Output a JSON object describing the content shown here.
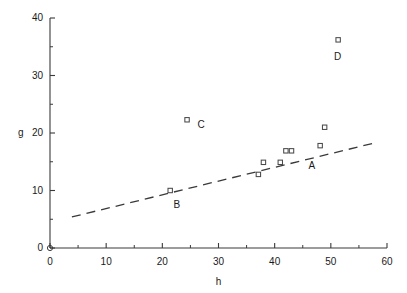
{
  "chart_data": {
    "type": "scatter",
    "title": "",
    "xlabel": "h",
    "ylabel": "g",
    "xlim": [
      0,
      60
    ],
    "ylim": [
      0,
      40
    ],
    "xticks": [
      0,
      10,
      20,
      30,
      40,
      50,
      60
    ],
    "yticks": [
      0,
      10,
      20,
      30,
      40
    ],
    "xtick_labels": [
      "0",
      "10",
      "20",
      "30",
      "40",
      "50",
      "60"
    ],
    "ytick_labels": [
      "0",
      "10",
      "20",
      "30",
      "40"
    ],
    "minor_ticks": true,
    "grid": false,
    "legend": null,
    "marker": "open-square",
    "series": [
      {
        "name": "data",
        "points": [
          {
            "h": 21.4,
            "g": 10.0,
            "label": "B"
          },
          {
            "h": 24.4,
            "g": 22.3,
            "label": "C"
          },
          {
            "h": 37.1,
            "g": 12.8,
            "label": ""
          },
          {
            "h": 38.0,
            "g": 14.9,
            "label": ""
          },
          {
            "h": 41.0,
            "g": 14.9,
            "label": ""
          },
          {
            "h": 42.0,
            "g": 16.9,
            "label": ""
          },
          {
            "h": 43.0,
            "g": 16.9,
            "label": ""
          },
          {
            "h": 48.1,
            "g": 17.8,
            "label": "A"
          },
          {
            "h": 48.9,
            "g": 21.0,
            "label": ""
          },
          {
            "h": 51.3,
            "g": 36.2,
            "label": "D"
          }
        ]
      }
    ],
    "trendline": {
      "style": "dashed",
      "x_start": 3.9,
      "y_start": 5.4,
      "x_end": 57.9,
      "y_end": 18.3
    },
    "annotations": [
      {
        "text": "A",
        "h": 46.6,
        "g": 14.3
      },
      {
        "text": "B",
        "h": 22.6,
        "g": 7.5
      },
      {
        "text": "C",
        "h": 26.9,
        "g": 21.4
      },
      {
        "text": "D",
        "h": 51.2,
        "g": 33.2
      }
    ]
  },
  "colors": {
    "axis": "#3a3a3a",
    "marker": "#4a4a4a",
    "trendline": "#3a3a3a",
    "text": "#1a1a1a",
    "background": "#ffffff"
  }
}
